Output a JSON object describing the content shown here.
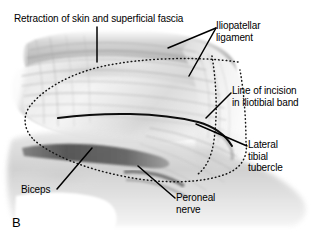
{
  "figure": {
    "letter": "B",
    "type": "anatomical-illustration",
    "background_color": "#ffffff",
    "line_color": "#000000",
    "text_color": "#000000"
  },
  "labels": {
    "retraction": "Retraction of skin and superficial fascia",
    "iliopatellar": "Iliopatellar\nligament",
    "incision": "Line of incision\nin iliotibial band",
    "tubercle": "Lateral\ntibial\ntubercle",
    "biceps": "Biceps",
    "peroneal": "Peroneal\nnerve"
  }
}
